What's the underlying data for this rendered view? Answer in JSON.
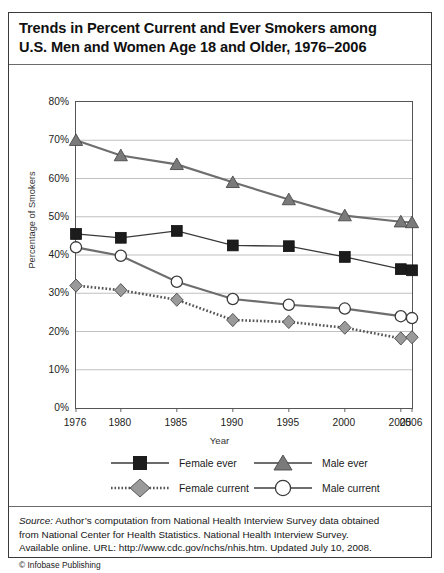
{
  "title": {
    "line1": "Trends in Percent Current and Ever Smokers among",
    "line2": "U.S. Men and Women Age 18 and Older, 1976–2006"
  },
  "chart_data": {
    "type": "line",
    "title": "Trends in Percent Current and Ever Smokers among U.S. Men and Women Age 18 and Older, 1976–2006",
    "xlabel": "Year",
    "ylabel": "Percentage of Smokers",
    "categories": [
      "1976",
      "1980",
      "1985",
      "1990",
      "1995",
      "2000",
      "2005",
      "2006"
    ],
    "x": [
      1976,
      1980,
      1985,
      1990,
      1995,
      2000,
      2005,
      2006
    ],
    "ylim": [
      0,
      80
    ],
    "ytick_labels": [
      "0%",
      "10%",
      "20%",
      "30%",
      "40%",
      "50%",
      "60%",
      "70%",
      "80%"
    ],
    "ytick_values": [
      0,
      10,
      20,
      30,
      40,
      50,
      60,
      70,
      80
    ],
    "grid": "horizontal",
    "legend_position": "bottom",
    "series": [
      {
        "name": "Female ever",
        "marker": "square",
        "marker_fill": "#1c1c1c",
        "line_style": "solid",
        "line_color": "#3a3a3a",
        "values": [
          45.5,
          44.5,
          46.3,
          42.5,
          42.3,
          39.5,
          36.3,
          36.0
        ]
      },
      {
        "name": "Male ever",
        "marker": "triangle",
        "marker_fill": "#7a7a7a",
        "line_style": "solid",
        "line_color": "#6e6e6e",
        "values": [
          70.0,
          66.0,
          63.7,
          59.0,
          54.5,
          50.3,
          48.7,
          48.5
        ]
      },
      {
        "name": "Female current",
        "marker": "diamond",
        "marker_fill": "#9a9a9a",
        "line_style": "dotted",
        "line_color": "#555555",
        "values": [
          32.0,
          30.8,
          28.3,
          23.0,
          22.5,
          21.0,
          18.2,
          18.5
        ]
      },
      {
        "name": "Male current",
        "marker": "circle",
        "marker_fill": "#ffffff",
        "line_style": "solid",
        "line_color": "#6e6e6e",
        "values": [
          42.0,
          39.8,
          33.0,
          28.5,
          27.0,
          26.0,
          24.0,
          23.5
        ]
      }
    ]
  },
  "legend": {
    "items": [
      {
        "label": "Female ever"
      },
      {
        "label": "Male ever"
      },
      {
        "label": "Female current"
      },
      {
        "label": "Male current"
      }
    ]
  },
  "source": {
    "keyword": "Source:",
    "line1": " Author’s computation from National Health Interview Survey data obtained",
    "line2": "from National Center for Health Statistics. National Health Interview Survey.",
    "line3": "Available online. URL: http://www.cdc.gov/nchs/nhis.htm. Updated July 10, 2008.",
    "credit": "© Infobase Publishing"
  }
}
